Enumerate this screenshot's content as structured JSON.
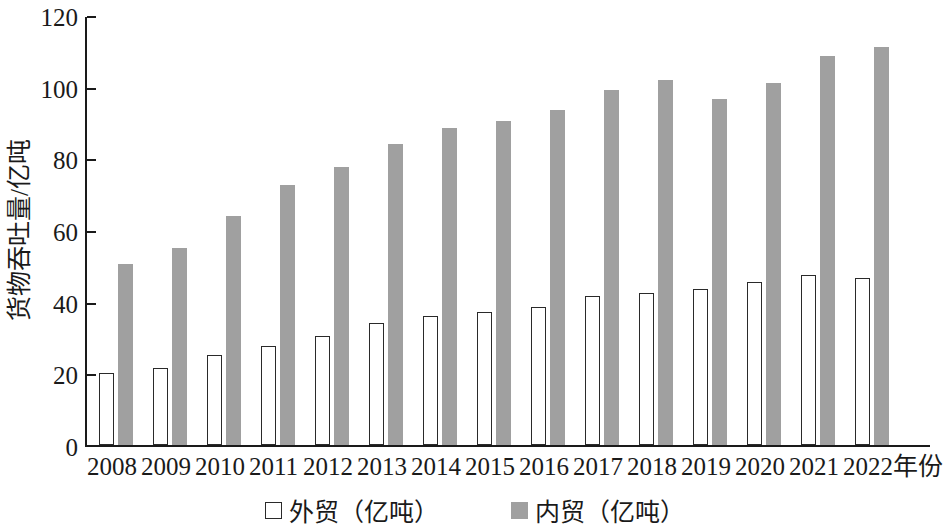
{
  "chart_data": {
    "type": "bar",
    "title": "",
    "xlabel": "年份",
    "ylabel": "货物吞吐量/亿吨",
    "categories": [
      "2008",
      "2009",
      "2010",
      "2011",
      "2012",
      "2013",
      "2014",
      "2015",
      "2016",
      "2017",
      "2018",
      "2019",
      "2020",
      "2021",
      "2022"
    ],
    "series": [
      {
        "name": "外贸（亿吨）",
        "color": "#ffffff",
        "edge_color": "#2a2a2a",
        "values": [
          20,
          21.5,
          25,
          27.5,
          30.5,
          34,
          36,
          37,
          38.5,
          41.5,
          42.5,
          43.5,
          45.5,
          47.5,
          46.5
        ]
      },
      {
        "name": "内贸（亿吨）",
        "color": "#a0a0a0",
        "edge_color": "#a0a0a0",
        "values": [
          50.5,
          55,
          64,
          72.5,
          77.5,
          84,
          88.5,
          90.5,
          93.5,
          99,
          102,
          96.5,
          101,
          108.5,
          111
        ]
      }
    ],
    "ylim": [
      0,
      120
    ],
    "yticks": [
      0,
      20,
      40,
      60,
      80,
      100,
      120
    ],
    "ytick_labels": [
      "0",
      "20",
      "40",
      "60",
      "80",
      "100",
      "120"
    ],
    "grid": false,
    "legend_position": "bottom-center"
  },
  "axis": {
    "y_label": "货物吞吐量/亿吨",
    "x_suffix": "年份",
    "ytick_labels": [
      "120",
      "100",
      "80",
      "60",
      "40",
      "20",
      "0"
    ]
  },
  "legend": {
    "items": [
      {
        "label": "外贸（亿吨）",
        "swatch": "open-square-swatch"
      },
      {
        "label": "内贸（亿吨）",
        "swatch": "filled-square-swatch"
      }
    ]
  }
}
